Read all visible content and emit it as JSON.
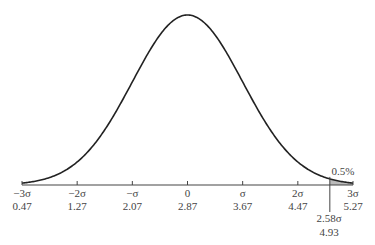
{
  "chart_data": {
    "type": "line",
    "title": "",
    "xlabel": "",
    "ylabel": "",
    "grid": false,
    "mean": 2.87,
    "sigma": 0.8,
    "ticks": [
      {
        "sigma_label": "−3σ",
        "value": "0.47"
      },
      {
        "sigma_label": "−2σ",
        "value": "1.27"
      },
      {
        "sigma_label": "−σ",
        "value": "2.07"
      },
      {
        "sigma_label": "0",
        "value": "2.87"
      },
      {
        "sigma_label": "σ",
        "value": "3.67"
      },
      {
        "sigma_label": "2σ",
        "value": "4.47"
      },
      {
        "sigma_label": "3σ",
        "value": "5.27"
      }
    ],
    "marker": {
      "sigma_label": "2.58σ",
      "value": "4.93"
    },
    "annotation": {
      "text": "0.5%",
      "region": "shaded tail beyond 2.58σ"
    },
    "xlim": [
      0.47,
      5.27
    ],
    "colors": {
      "curve": "#222222",
      "shade": "#bbbbbb",
      "axis": "#444444"
    }
  }
}
